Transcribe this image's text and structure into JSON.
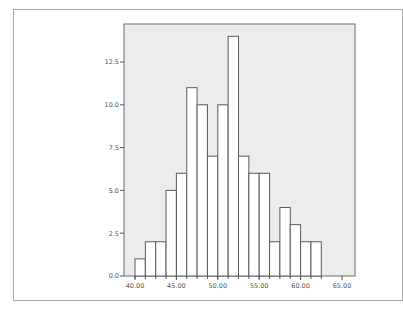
{
  "chart_data": {
    "type": "bar",
    "subtype": "histogram",
    "title": "",
    "xlabel": "",
    "ylabel": "",
    "bin_width": 1.25,
    "bin_start": 40.0,
    "bins": [
      {
        "x0": 40.0,
        "x1": 41.25,
        "count": 1
      },
      {
        "x0": 41.25,
        "x1": 42.5,
        "count": 2
      },
      {
        "x0": 42.5,
        "x1": 43.75,
        "count": 2
      },
      {
        "x0": 43.75,
        "x1": 45.0,
        "count": 5
      },
      {
        "x0": 45.0,
        "x1": 46.25,
        "count": 6
      },
      {
        "x0": 46.25,
        "x1": 47.5,
        "count": 11
      },
      {
        "x0": 47.5,
        "x1": 48.75,
        "count": 10
      },
      {
        "x0": 48.75,
        "x1": 50.0,
        "count": 7
      },
      {
        "x0": 50.0,
        "x1": 51.25,
        "count": 10
      },
      {
        "x0": 51.25,
        "x1": 52.5,
        "count": 14
      },
      {
        "x0": 52.5,
        "x1": 53.75,
        "count": 7
      },
      {
        "x0": 53.75,
        "x1": 55.0,
        "count": 6
      },
      {
        "x0": 55.0,
        "x1": 56.25,
        "count": 6
      },
      {
        "x0": 56.25,
        "x1": 57.5,
        "count": 2
      },
      {
        "x0": 57.5,
        "x1": 58.75,
        "count": 4
      },
      {
        "x0": 58.75,
        "x1": 60.0,
        "count": 3
      },
      {
        "x0": 60.0,
        "x1": 61.25,
        "count": 2
      },
      {
        "x0": 61.25,
        "x1": 62.5,
        "count": 2
      }
    ],
    "values": [
      1,
      2,
      2,
      5,
      6,
      11,
      10,
      7,
      10,
      14,
      7,
      6,
      6,
      2,
      4,
      3,
      2,
      2
    ],
    "x_ticks": [
      "40.00",
      "45.00",
      "50.00",
      "55.00",
      "60.00",
      "65.00"
    ],
    "x_tick_values": [
      40,
      45,
      50,
      55,
      60,
      65
    ],
    "y_ticks": [
      "0.0",
      "2.5",
      "5.0",
      "7.5",
      "10.0",
      "12.5"
    ],
    "y_tick_values": [
      0,
      2.5,
      5,
      7.5,
      10,
      12.5
    ],
    "xlim": [
      38.7,
      66.6
    ],
    "ylim": [
      0,
      14.7
    ],
    "grid": false,
    "legend": null,
    "colors": {
      "plot_background": "#ececec",
      "bar_fill": "#ffffff",
      "bar_stroke": "#5a5a5a",
      "axis": "#555555",
      "frame": "#a8a8a8"
    }
  }
}
